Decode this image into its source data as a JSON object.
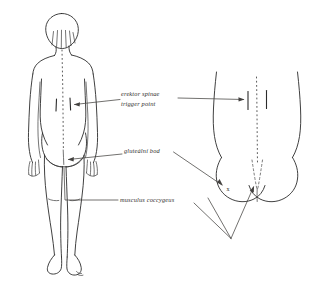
{
  "figure": {
    "background_color": "#ffffff",
    "ink_color": "#2b2b2b",
    "style": "hand-drawn pen sketch"
  },
  "labels": [
    {
      "id": "erector-spinae",
      "line1": "erektor spinae",
      "line2": "trigger point",
      "x": 121,
      "y": 95
    },
    {
      "id": "gluteal-point",
      "line1": "gluteální bod",
      "line2": "",
      "x": 124,
      "y": 155
    },
    {
      "id": "coccygeus",
      "line1": "musculus coccygeus",
      "line2": "",
      "x": 120,
      "y": 201
    }
  ],
  "markers": {
    "gluteal_x_mark": "x"
  },
  "signature": {
    "text": "sig"
  },
  "views": {
    "left": {
      "name": "full-body-posterior-view",
      "description": "Standing figure seen from behind with dotted spinal midline"
    },
    "right": {
      "name": "buttocks-detail-view",
      "description": "Close-up posterior view of lower back and gluteal region"
    }
  }
}
